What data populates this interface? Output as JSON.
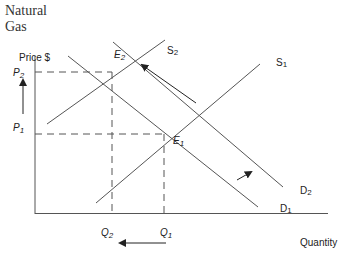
{
  "title": {
    "line1": "Natural",
    "line2": "Gas"
  },
  "axes": {
    "y_label": "Price $",
    "x_label": "Quantity"
  },
  "price_labels": {
    "p2": "P",
    "p2_sub": "2",
    "p1": "P",
    "p1_sub": "1"
  },
  "quantity_labels": {
    "q2": "Q",
    "q2_sub": "2",
    "q1": "Q",
    "q1_sub": "1"
  },
  "equilibria": {
    "e2": "E",
    "e2_sub": "2",
    "e1": "E",
    "e1_sub": "1"
  },
  "curves": {
    "s2": "S",
    "s2_sub": "2",
    "s1": "S",
    "s1_sub": "1",
    "d2": "D",
    "d2_sub": "2",
    "d1": "D",
    "d1_sub": "1"
  },
  "colors": {
    "line": "#555555",
    "text": "#222222",
    "background": "#ffffff"
  }
}
